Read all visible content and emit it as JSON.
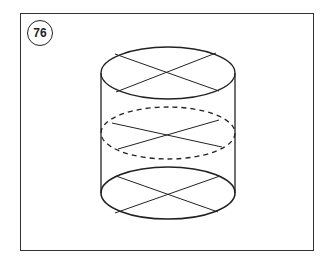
{
  "figure": {
    "number": "76"
  },
  "colors": {
    "stroke": "#222222",
    "frame": "#333333",
    "background": "#ffffff"
  }
}
